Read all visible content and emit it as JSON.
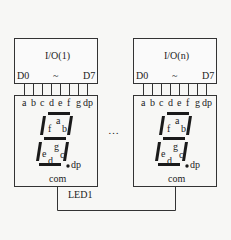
{
  "modules": [
    {
      "io_label": "I/O(1)",
      "pin_start": "D0",
      "pin_sep": "~",
      "pin_end": "D7",
      "segments": [
        "a",
        "b",
        "c",
        "d",
        "e",
        "f",
        "g",
        "dp"
      ],
      "digit_labels": {
        "a": "a",
        "b": "b",
        "c": "c",
        "d": "d",
        "e": "e",
        "f": "f",
        "g": "g",
        "dp": "dp"
      },
      "common_label": "com"
    },
    {
      "io_label": "I/O(n)",
      "pin_start": "D0",
      "pin_sep": "~",
      "pin_end": "D7",
      "segments": [
        "a",
        "b",
        "c",
        "d",
        "e",
        "f",
        "g",
        "dp"
      ],
      "digit_labels": {
        "a": "a",
        "b": "b",
        "c": "c",
        "d": "d",
        "e": "e",
        "f": "f",
        "g": "g",
        "dp": "dp"
      },
      "common_label": "com"
    }
  ],
  "ellipsis": "…",
  "bus_label": "LED1",
  "colors": {
    "line": "#333333",
    "segment": "#1a1a1a",
    "background": "#f7f7f5"
  }
}
